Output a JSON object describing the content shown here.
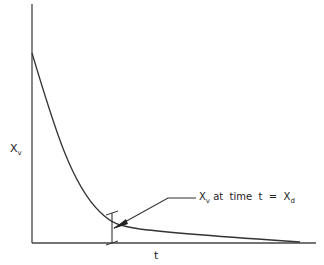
{
  "diagram": {
    "type": "decay-curve",
    "y_axis_label": "X",
    "y_axis_label_sub": "v",
    "x_axis_label": "t",
    "annotation": {
      "prefix": "X",
      "prefix_sub": "v",
      "text": " at  time  t  =  X",
      "suffix_sub": "d"
    },
    "colors": {
      "line": "#333333",
      "background": "#ffffff"
    }
  }
}
